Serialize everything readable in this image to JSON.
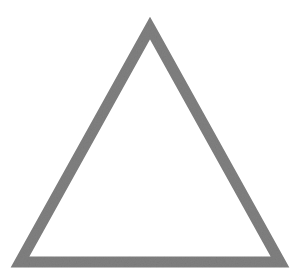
{
  "canvas": {
    "width": 302,
    "height": 276,
    "background_color": "#ffffff",
    "alt_text": "Outline of a triangle"
  },
  "figure": {
    "name": "triangle",
    "type": "polygon",
    "sides": 3,
    "closed": true,
    "fill": "none",
    "stroke_color": "#808080",
    "stroke_width": 11,
    "stroke_linejoin": "miter",
    "texture": "dithered-grain",
    "vertices": [
      {
        "label": "apex",
        "x": 150,
        "y": 28
      },
      {
        "label": "bottom-right",
        "x": 280,
        "y": 262
      },
      {
        "label": "bottom-left",
        "x": 20,
        "y": 262
      }
    ],
    "points_attr": "150,28 280,262 20,262",
    "bounding_box": {
      "x": 14,
      "y": 22,
      "width": 272,
      "height": 246
    }
  }
}
